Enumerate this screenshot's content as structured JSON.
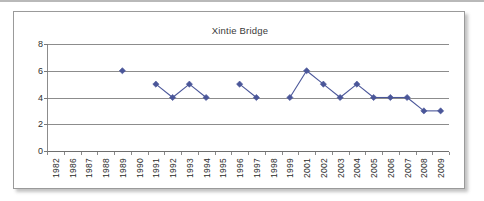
{
  "figure": {
    "title": "Xintie Bridge"
  },
  "chart_data": {
    "type": "line",
    "title": "Xintie Bridge",
    "xlabel": "",
    "ylabel": "",
    "ylim": [
      0,
      8
    ],
    "yticks": [
      0,
      2,
      4,
      6,
      8
    ],
    "ytick_labels": [
      "0",
      "2",
      "4",
      "6",
      "8"
    ],
    "grid": true,
    "legend": "none",
    "marker": "diamond",
    "series_color": "#4a5699",
    "categories": [
      "1982",
      "1986",
      "1987",
      "1988",
      "1989",
      "1990",
      "1991",
      "1992",
      "1993",
      "1994",
      "1995",
      "1996",
      "1997",
      "1998",
      "1999",
      "2001",
      "2002",
      "2003",
      "2004",
      "2005",
      "2006",
      "2007",
      "2008",
      "2009"
    ],
    "series": [
      {
        "name": "Xintie Bridge",
        "values": [
          null,
          null,
          null,
          null,
          6,
          null,
          5,
          4,
          5,
          4,
          null,
          5,
          4,
          null,
          4,
          6,
          5,
          4,
          5,
          4,
          4,
          4,
          3,
          3
        ]
      }
    ]
  }
}
